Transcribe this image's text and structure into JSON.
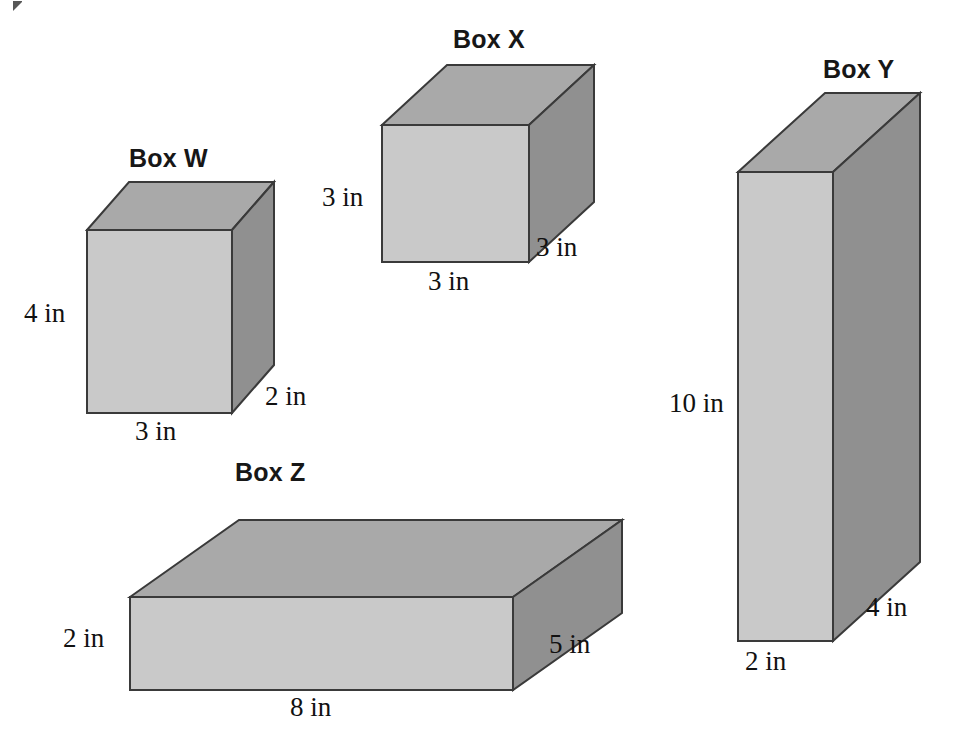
{
  "figure": {
    "background_color": "#ffffff",
    "outline_color": "#3a3a3a",
    "face_colors": {
      "front": "#c9c9c9",
      "top": "#a9a9a9",
      "right": "#909090"
    },
    "boxes": [
      {
        "id": "box-w",
        "title": "Box W",
        "title_pos": {
          "x": 129,
          "y": 146
        },
        "front": {
          "x": 87,
          "y": 230,
          "w": 145,
          "h": 183
        },
        "depth": {
          "dx": 42,
          "dy": -48
        },
        "dimensions": {
          "height": {
            "text": "4 in",
            "x": 24,
            "y": 300
          },
          "width": {
            "text": "3 in",
            "x": 135,
            "y": 418
          },
          "depth": {
            "text": "2 in",
            "x": 265,
            "y": 383
          }
        },
        "measures": {
          "width_in": 3,
          "height_in": 4,
          "depth_in": 2
        }
      },
      {
        "id": "box-x",
        "title": "Box X",
        "title_pos": {
          "x": 453,
          "y": 27
        },
        "front": {
          "x": 382,
          "y": 125,
          "w": 147,
          "h": 137
        },
        "depth": {
          "dx": 65,
          "dy": -60
        },
        "dimensions": {
          "height": {
            "text": "3 in",
            "x": 322,
            "y": 184
          },
          "width": {
            "text": "3 in",
            "x": 428,
            "y": 268
          },
          "depth": {
            "text": "3 in",
            "x": 536,
            "y": 234
          }
        },
        "measures": {
          "width_in": 3,
          "height_in": 3,
          "depth_in": 3
        }
      },
      {
        "id": "box-y",
        "title": "Box Y",
        "title_pos": {
          "x": 823,
          "y": 57
        },
        "front": {
          "x": 738,
          "y": 172,
          "w": 95,
          "h": 469
        },
        "depth": {
          "dx": 87,
          "dy": -79
        },
        "dimensions": {
          "height": {
            "text": "10 in",
            "x": 669,
            "y": 390
          },
          "width": {
            "text": "2 in",
            "x": 745,
            "y": 648
          },
          "depth": {
            "text": "4 in",
            "x": 866,
            "y": 594
          }
        },
        "measures": {
          "width_in": 2,
          "height_in": 10,
          "depth_in": 4
        }
      },
      {
        "id": "box-z",
        "title": "Box Z",
        "title_pos": {
          "x": 235,
          "y": 460
        },
        "front": {
          "x": 130,
          "y": 597,
          "w": 383,
          "h": 93
        },
        "depth": {
          "dx": 109,
          "dy": -77
        },
        "dimensions": {
          "height": {
            "text": "2 in",
            "x": 63,
            "y": 625
          },
          "width": {
            "text": "8 in",
            "x": 290,
            "y": 694
          },
          "depth": {
            "text": "5 in",
            "x": 549,
            "y": 631
          }
        },
        "measures": {
          "width_in": 8,
          "height_in": 2,
          "depth_in": 5
        }
      }
    ]
  }
}
